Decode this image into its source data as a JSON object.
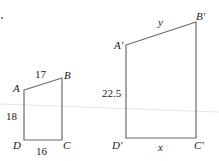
{
  "figure": {
    "small": {
      "vertices": {
        "A": "A",
        "B": "B",
        "C": "C",
        "D": "D"
      },
      "sides": {
        "AB": "17",
        "AD": "18",
        "DC": "16"
      }
    },
    "large": {
      "vertices": {
        "A": "A'",
        "B": "B'",
        "C": "C'",
        "D": "D'"
      },
      "sides": {
        "AB": "y",
        "AD": "22.5",
        "DC": "x"
      }
    },
    "colors": {
      "stroke": "#6b6b6b",
      "text": "#1a1a1a",
      "background": "#ffffff"
    }
  }
}
